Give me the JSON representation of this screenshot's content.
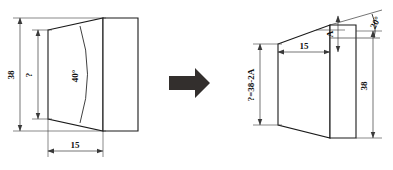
{
  "figure": {
    "background_color": "#ffffff",
    "line_color": "#1a1a1a",
    "arrow_color": "#332f2d",
    "transition_arrow": {
      "name": "transition-arrow",
      "direction": "right"
    },
    "left_view": {
      "name": "left-view",
      "description": "Tapered die with included angle callout",
      "labels": {
        "height_overall": "38",
        "height_inner": "?",
        "angle": "40°",
        "length": "15"
      }
    },
    "right_view": {
      "name": "right-view",
      "description": "Tapered die with half angle and offset callout",
      "labels": {
        "height_formula": "?=38-2A",
        "length": "15",
        "offset": "A",
        "angle": "20°",
        "height_overall": "38"
      }
    }
  }
}
